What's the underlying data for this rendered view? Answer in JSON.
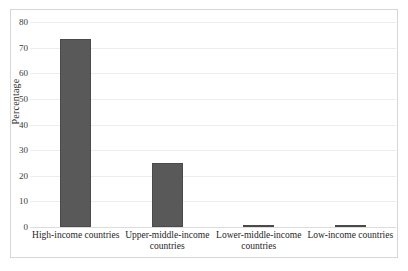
{
  "chart_data": {
    "type": "bar",
    "title": "",
    "xlabel": "",
    "ylabel": "Percentage",
    "ylim": [
      0,
      80
    ],
    "ytick_step": 10,
    "yticks": [
      80,
      70,
      60,
      50,
      40,
      30,
      20,
      10,
      0
    ],
    "grid": true,
    "legend": "none",
    "bar_color": "#595959",
    "categories": [
      "High-income countries",
      "Upper-middle-income countries",
      "Lower-middle-income countries",
      "Low-income countries"
    ],
    "category_lines": [
      [
        "High-income countries"
      ],
      [
        "Upper-middle-income",
        "countries"
      ],
      [
        "Lower-middle-income",
        "countries"
      ],
      [
        "Low-income countries"
      ]
    ],
    "values": [
      73.5,
      25.0,
      0.8,
      0.5
    ]
  }
}
